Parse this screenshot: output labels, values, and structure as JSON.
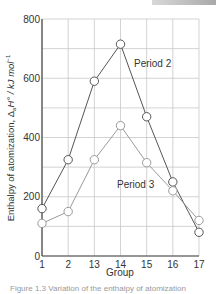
{
  "chart_data": {
    "type": "line",
    "title": "",
    "xlabel": "Group",
    "ylabel": "Enthalpy of atomization, ΔaH° / kJ mol⁻¹",
    "categories": [
      "1",
      "2",
      "13",
      "14",
      "15",
      "16",
      "17"
    ],
    "yticks": [
      "0",
      "200",
      "400",
      "600",
      "800"
    ],
    "ylim": [
      0,
      800
    ],
    "grid": true,
    "series": [
      {
        "name": "Period 2",
        "values": [
          160,
          325,
          590,
          715,
          470,
          250,
          80
        ]
      },
      {
        "name": "Period 3",
        "values": [
          110,
          150,
          325,
          440,
          315,
          220,
          120
        ]
      }
    ],
    "annotations": [
      {
        "text": "Period 2",
        "x_group": "14-15",
        "y": 670
      },
      {
        "text": "Period 3",
        "x_group": "14-15",
        "y": 250
      }
    ]
  },
  "labels": {
    "xlabel": "Group",
    "ylabel_main": "Enthalpy of atomization, Δ",
    "ylabel_sub": "a",
    "ylabel_rest": "H° / kJ mol",
    "ylabel_sup": "−1",
    "period2": "Period 2",
    "period3": "Period 3",
    "caption": "Figure 1.3 Variation of the enthalpy of atomization"
  },
  "colors": {
    "period2_line": "#555555",
    "period3_line": "#9a9a9a",
    "grid": "#c8c8c8",
    "axis": "#444444"
  }
}
